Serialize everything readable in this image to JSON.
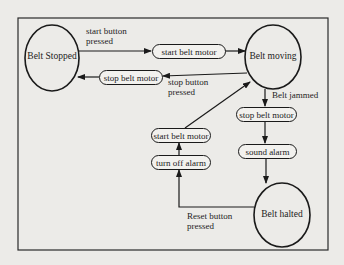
{
  "diagram": {
    "type": "state-transition",
    "states": [
      {
        "id": "stopped",
        "label": "Belt Stopped"
      },
      {
        "id": "moving",
        "label": "Belt moving"
      },
      {
        "id": "halted",
        "label": "Belt halted"
      }
    ],
    "actions": {
      "start_motor_top": "start belt motor",
      "stop_motor_top": "stop belt motor",
      "stop_motor_right": "stop belt motor",
      "sound_alarm": "sound alarm",
      "start_motor_left": "start belt motor",
      "turn_off_alarm": "turn off alarm"
    },
    "events": {
      "start_pressed_1": "start button",
      "start_pressed_2": "pressed",
      "stop_pressed_1": "stop button",
      "stop_pressed_2": "pressed",
      "belt_jammed": "Belt jammed",
      "reset_pressed_1": "Reset button",
      "reset_pressed_2": "pressed"
    },
    "transitions": [
      {
        "from": "Belt Stopped",
        "to": "Belt moving",
        "event": "start button pressed",
        "actions": [
          "start belt motor"
        ]
      },
      {
        "from": "Belt moving",
        "to": "Belt Stopped",
        "event": "stop button pressed",
        "actions": [
          "stop belt motor"
        ]
      },
      {
        "from": "Belt moving",
        "to": "Belt halted",
        "event": "Belt jammed",
        "actions": [
          "stop belt motor",
          "sound alarm"
        ]
      },
      {
        "from": "Belt halted",
        "to": "Belt moving",
        "event": "Reset button pressed",
        "actions": [
          "turn off alarm",
          "start belt motor"
        ]
      }
    ],
    "colors": {
      "stroke": "#1a1a1a",
      "background": "#ecebe8"
    }
  }
}
